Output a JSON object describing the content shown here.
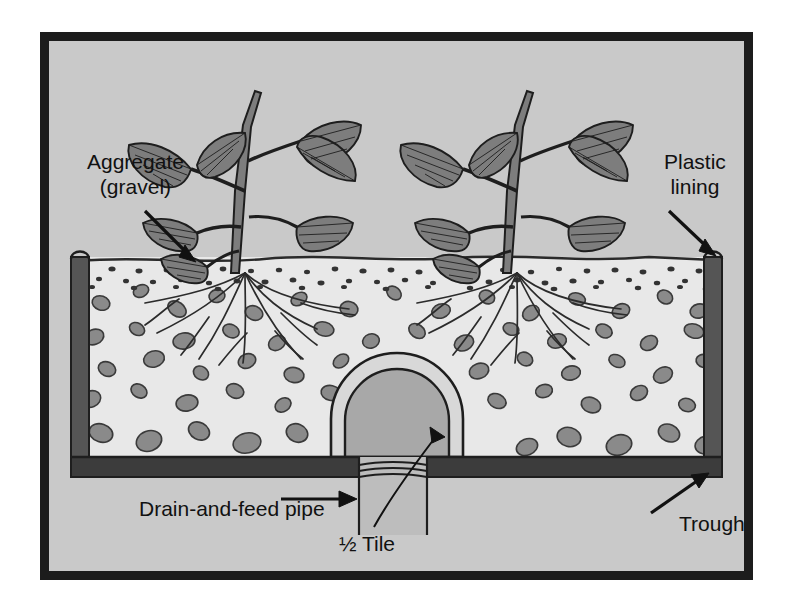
{
  "figure": {
    "type": "cross-section-diagram",
    "colors": {
      "frame_border": "#1c1c1c",
      "plate_background": "#c9c9c9",
      "gravel_fill": "#e8e8e8",
      "stone": "#8a8a8a",
      "stone_outline": "#3a3a3a",
      "wall_dark": "#555555",
      "lining_light": "#e6e6e6",
      "floor_dark": "#3c3c3c",
      "plant": "#777777",
      "plant_outline": "#1e1e1e",
      "label_text": "#111111",
      "pipe_fill": "#bdbdbd",
      "tile_ring": "#d8d8d8",
      "tile_interior": "#a8a8a8"
    },
    "labels": [
      {
        "id": "aggregate",
        "line1": "Aggregate",
        "line2": "(gravel)",
        "pointer": "arrow-down-right"
      },
      {
        "id": "plastic_lining",
        "line1": "Plastic",
        "line2": "lining",
        "pointer": "arrow-down-right"
      },
      {
        "id": "drain_feed_pipe",
        "line1": "Drain-and-feed pipe",
        "pointer": "arrow-right"
      },
      {
        "id": "half_tile",
        "line1": "½ Tile",
        "pointer": "leader-up-left"
      },
      {
        "id": "trough",
        "line1": "Trough",
        "pointer": "arrow-up-right"
      }
    ],
    "parts": [
      "plant-left",
      "plant-right",
      "root-system-left",
      "root-system-right",
      "gravel-bed",
      "fine-gravel-surface",
      "left-wall",
      "right-wall",
      "plastic-lining",
      "trough-floor",
      "half-tile-arch",
      "drain-feed-pipe"
    ]
  }
}
